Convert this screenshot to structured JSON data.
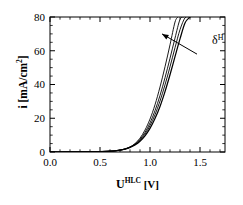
{
  "chart_data": {
    "type": "line",
    "title": "",
    "xlabel": "U^HLC [V]",
    "xlabel_base": "U",
    "xlabel_sup": "HLC",
    "xlabel_unit": "[V]",
    "ylabel": "i [mA/cm2]",
    "ylabel_text": "i [mA/cm",
    "ylabel_sup": "2",
    "ylabel_tail": "]",
    "xlim": [
      0.0,
      1.75
    ],
    "ylim": [
      0,
      80
    ],
    "xticks": [
      0.0,
      0.5,
      1.0,
      1.5
    ],
    "xtick_labels": [
      "0.0",
      "0.5",
      "1.0",
      "1.5"
    ],
    "xminor_step": 0.1,
    "yticks": [
      0,
      20,
      40,
      60,
      80
    ],
    "ytick_labels": [
      "0",
      "20",
      "40",
      "60",
      "80"
    ],
    "yminor_step": 5,
    "grid": false,
    "legend": "none",
    "line_color": "#000000",
    "annotations": [
      {
        "name": "delta-H-arrow",
        "text": "δ",
        "superscript": "H",
        "label_x": 1.62,
        "label_y": 64,
        "arrow_from_x": 1.47,
        "arrow_from_y": 58,
        "arrow_to_x": 1.12,
        "arrow_to_y": 70
      }
    ],
    "series": [
      {
        "name": "curve-1",
        "x": [
          0.0,
          0.1,
          0.2,
          0.3,
          0.4,
          0.5,
          0.55,
          0.6,
          0.65,
          0.7,
          0.75,
          0.8,
          0.85,
          0.9,
          0.95,
          1.0,
          1.05,
          1.1,
          1.15,
          1.2,
          1.25,
          1.28
        ],
        "y": [
          0.0,
          0.0,
          0.05,
          0.1,
          0.15,
          0.25,
          0.35,
          0.5,
          0.7,
          1.1,
          1.8,
          3.0,
          5.0,
          8.2,
          13.0,
          19.5,
          28.0,
          38.5,
          50.5,
          63.5,
          77.0,
          80.0
        ]
      },
      {
        "name": "curve-2",
        "x": [
          0.0,
          0.1,
          0.2,
          0.3,
          0.4,
          0.5,
          0.55,
          0.6,
          0.65,
          0.7,
          0.75,
          0.8,
          0.85,
          0.9,
          0.95,
          1.0,
          1.05,
          1.1,
          1.15,
          1.2,
          1.25,
          1.3,
          1.34
        ],
        "y": [
          0.0,
          0.0,
          0.05,
          0.1,
          0.15,
          0.25,
          0.35,
          0.5,
          0.7,
          1.1,
          1.8,
          2.9,
          4.7,
          7.5,
          11.6,
          17.2,
          24.5,
          33.5,
          44.0,
          55.5,
          67.5,
          78.5,
          80.0
        ]
      },
      {
        "name": "curve-3",
        "x": [
          0.0,
          0.1,
          0.2,
          0.3,
          0.4,
          0.5,
          0.55,
          0.6,
          0.65,
          0.7,
          0.75,
          0.8,
          0.85,
          0.9,
          0.95,
          1.0,
          1.05,
          1.1,
          1.15,
          1.2,
          1.25,
          1.3,
          1.35,
          1.39
        ],
        "y": [
          0.0,
          0.0,
          0.05,
          0.1,
          0.15,
          0.25,
          0.35,
          0.5,
          0.7,
          1.05,
          1.7,
          2.8,
          4.4,
          6.9,
          10.6,
          15.6,
          22.1,
          30.2,
          39.8,
          50.5,
          61.8,
          72.5,
          79.5,
          80.0
        ]
      },
      {
        "name": "curve-4",
        "x": [
          0.0,
          0.1,
          0.2,
          0.3,
          0.4,
          0.5,
          0.55,
          0.6,
          0.65,
          0.7,
          0.75,
          0.8,
          0.85,
          0.9,
          0.95,
          1.0,
          1.05,
          1.1,
          1.15,
          1.2,
          1.25,
          1.3,
          1.35,
          1.4,
          1.44
        ],
        "y": [
          0.0,
          0.0,
          0.05,
          0.1,
          0.15,
          0.25,
          0.35,
          0.5,
          0.7,
          1.05,
          1.7,
          2.7,
          4.2,
          6.4,
          9.6,
          14.0,
          19.8,
          27.0,
          35.8,
          45.8,
          56.5,
          67.0,
          76.5,
          80.0,
          80.0
        ]
      }
    ]
  }
}
